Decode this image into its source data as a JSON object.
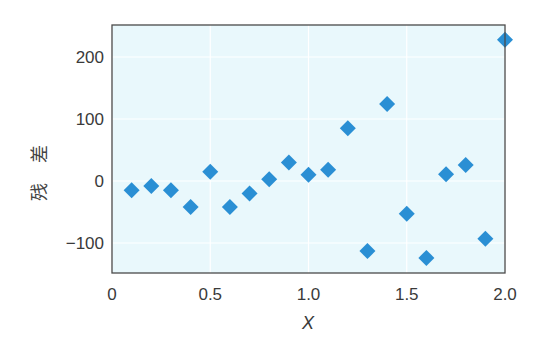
{
  "chart_data": {
    "type": "scatter",
    "title": "",
    "xlabel": "X",
    "ylabel": "残差",
    "xlim": [
      0,
      2.0
    ],
    "ylim": [
      -150,
      250
    ],
    "x_ticks": [
      0,
      0.5,
      1.0,
      1.5,
      2.0
    ],
    "x_tick_labels": [
      "0",
      "0.5",
      "1.0",
      "1.5",
      "2.0"
    ],
    "y_ticks": [
      -100,
      0,
      100,
      200
    ],
    "y_tick_labels": [
      "−100",
      "0",
      "100",
      "200"
    ],
    "grid": true,
    "legend": null,
    "marker": "diamond",
    "series": [
      {
        "name": "residuals",
        "color": "#2a8fd4",
        "x": [
          0.1,
          0.2,
          0.3,
          0.4,
          0.5,
          0.6,
          0.7,
          0.8,
          0.9,
          1.0,
          1.1,
          1.2,
          1.3,
          1.4,
          1.5,
          1.6,
          1.7,
          1.8,
          1.9,
          2.0
        ],
        "y": [
          -15,
          -8,
          -15,
          -42,
          15,
          -42,
          -20,
          3,
          30,
          10,
          18,
          85,
          -113,
          124,
          -53,
          -124,
          11,
          26,
          -93,
          228
        ]
      }
    ]
  },
  "colors": {
    "plot_background": "#e9f8fc",
    "grid": "#ffffff",
    "frame": "#4a4a4a",
    "marker": "#2a8fd4"
  }
}
